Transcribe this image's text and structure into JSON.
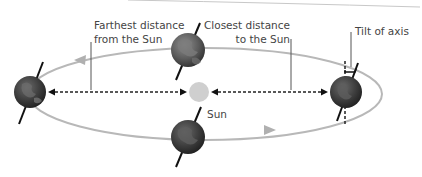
{
  "diagram": {
    "labels": {
      "farthest_line1": "Farthest distance",
      "farthest_line2": "from the Sun",
      "closest_line1": "Closest distance",
      "closest_line2": "to the Sun",
      "tilt": "Tilt of axis",
      "sun": "Sun"
    },
    "colors": {
      "orbit": "#b5b5b5",
      "sun": "#d0d0d0",
      "earth": "#555555",
      "earth_land": "#8a8a8a",
      "axis": "#111111",
      "distance_arrow": "#222222",
      "leader_line": "#444444",
      "text": "#444444"
    },
    "earth_positions": [
      "left",
      "top",
      "bottom",
      "right"
    ]
  }
}
